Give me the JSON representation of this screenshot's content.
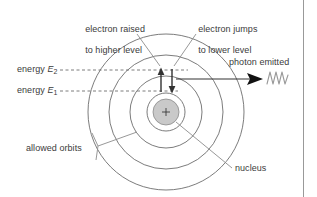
{
  "figure": {
    "background_color": "#ffffff",
    "line_color": "#6d6d6d",
    "text_color": "#3b3b3b",
    "nucleus_fill": "#c9c9c9",
    "width": 317,
    "height": 197
  },
  "labels": {
    "electron_raised_line1": "electron raised",
    "electron_raised_line2": "to higher level",
    "electron_jumps_line1": "electron jumps",
    "electron_jumps_line2": "to lower level",
    "energy_e2_word": "energy ",
    "energy_e2_symbol": "E",
    "energy_e2_sub": "2",
    "energy_e1_word": "energy ",
    "energy_e1_symbol": "E",
    "energy_e1_sub": "1",
    "photon_emitted": "photon emitted",
    "allowed_orbits": "allowed orbits",
    "nucleus": "nucleus",
    "nucleus_charge": "+"
  },
  "diagram": {
    "center_x": 166,
    "center_y": 112,
    "orbit_radii": [
      78,
      57,
      36,
      19
    ],
    "nucleus_radius": 13,
    "energy_level_2_y": 70,
    "energy_level_1_y": 91,
    "dashed_line_start_x": 60,
    "photon_arrow_start_x": 176,
    "photon_arrow_end_x": 262,
    "photon_arrow_y": 79,
    "arrow_up_x": 161,
    "arrow_down_x": 172
  }
}
